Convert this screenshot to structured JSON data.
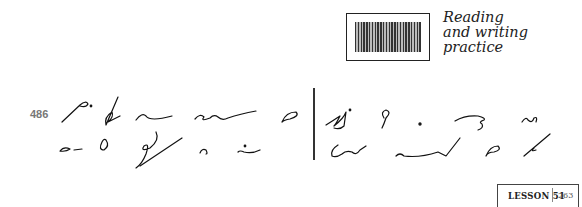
{
  "header": {
    "icon": "reading-writing-practice-icon",
    "title_lines": [
      "Reading",
      "and writing",
      "practice"
    ]
  },
  "exercise": {
    "number": "486",
    "content_type": "shorthand outlines (Gregg)",
    "rows": 2,
    "divider": "vertical line separating left and right outline groups"
  },
  "footer": {
    "lesson_label": "LESSON 51",
    "page_number": "263"
  }
}
